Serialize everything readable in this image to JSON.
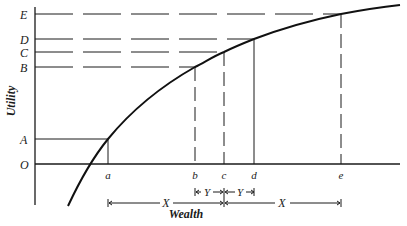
{
  "diagram": {
    "type": "utility-of-wealth curve",
    "y_axis_label": "Utility",
    "x_axis_label": "Wealth",
    "y_levels": [
      {
        "label": "E",
        "y": 14
      },
      {
        "label": "D",
        "y": 39
      },
      {
        "label": "C",
        "y": 52
      },
      {
        "label": "B",
        "y": 67
      },
      {
        "label": "A",
        "y": 139
      },
      {
        "label": "O",
        "y": 164
      }
    ],
    "x_points": [
      {
        "label": "a",
        "x": 108
      },
      {
        "label": "b",
        "x": 195
      },
      {
        "label": "c",
        "x": 224
      },
      {
        "label": "d",
        "x": 254
      },
      {
        "label": "e",
        "x": 341
      }
    ],
    "intervals": [
      {
        "label": "X",
        "from": "a",
        "to": "c"
      },
      {
        "label": "Y",
        "from": "b",
        "to": "c"
      },
      {
        "label": "Y",
        "from": "c",
        "to": "d"
      },
      {
        "label": "X",
        "from": "c",
        "to": "e"
      }
    ],
    "colors": {
      "ink": "#1a1a1a",
      "background": "#ffffff"
    }
  }
}
